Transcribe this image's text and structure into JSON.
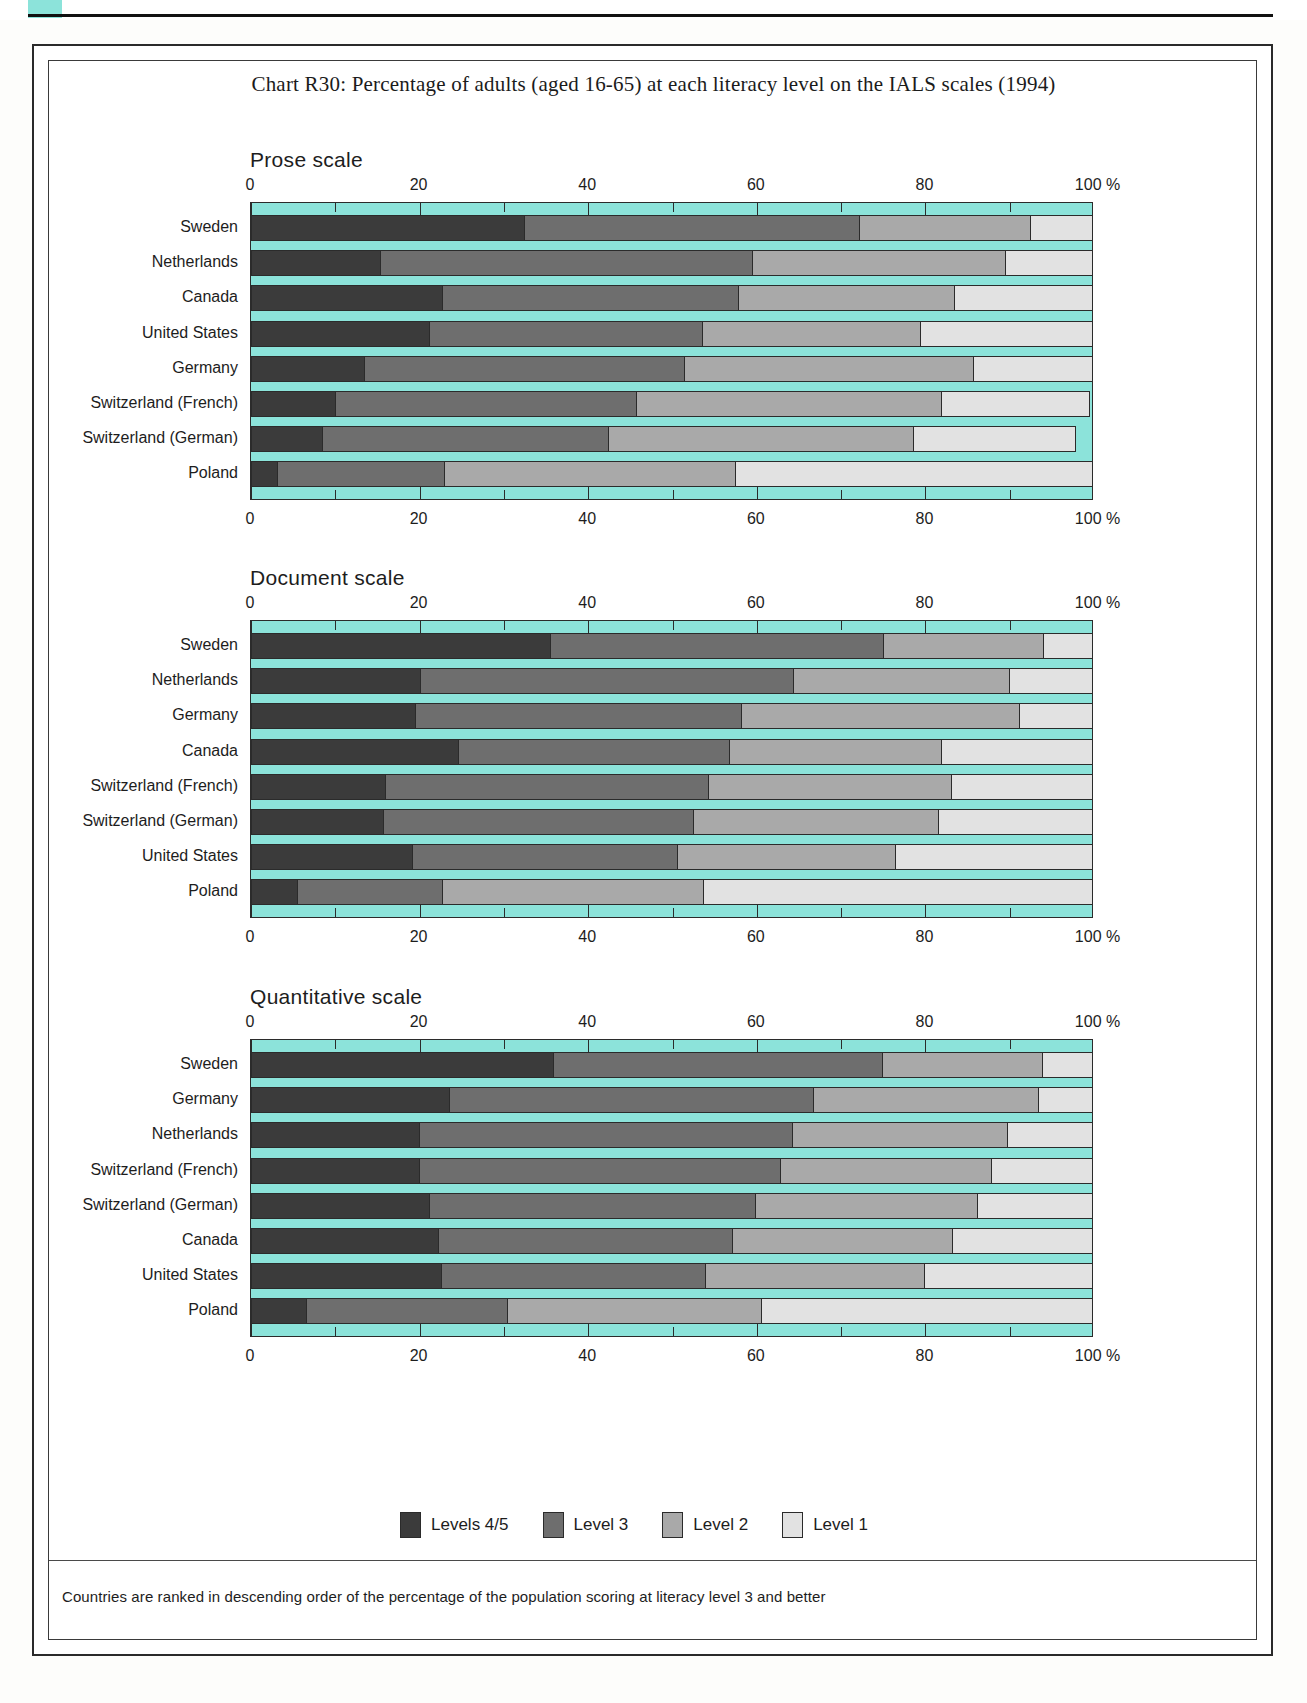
{
  "title": "Chart R30: Percentage of adults (aged 16-65) at each literacy level on the IALS scales (1994)",
  "footnote": "Countries are ranked in descending order of the percentage of the population scoring at literacy level 3 and better",
  "axis": {
    "ticks": [
      "0",
      "20",
      "40",
      "60",
      "80",
      "100"
    ],
    "unit": "%",
    "last_label": "100 %"
  },
  "legend": {
    "position": "bottom-center",
    "items": [
      {
        "label": "Levels 4/5",
        "color": "#3b3b3b",
        "key": "l45"
      },
      {
        "label": "Level 3",
        "color": "#6e6e6e",
        "key": "l3"
      },
      {
        "label": "Level 2",
        "color": "#a9a9a9",
        "key": "l2"
      },
      {
        "label": "Level 1",
        "color": "#e2e2e2",
        "key": "l1"
      }
    ]
  },
  "colors": {
    "plot_background": "#8ce3da",
    "level45": "#3b3b3b",
    "level3": "#6e6e6e",
    "level2": "#a9a9a9",
    "level1": "#e2e2e2",
    "outline": "#2b2b2b"
  },
  "panels": [
    {
      "key": "prose",
      "title": "Prose scale"
    },
    {
      "key": "document",
      "title": "Document scale"
    },
    {
      "key": "quantitative",
      "title": "Quantitative scale"
    }
  ],
  "chart_data": [
    {
      "type": "bar",
      "orientation": "horizontal",
      "stacked": true,
      "percent": true,
      "title": "Prose scale",
      "xlabel": "%",
      "ylabel": "",
      "xlim": [
        0,
        100
      ],
      "xticks": [
        0,
        20,
        40,
        60,
        80,
        100
      ],
      "grid": false,
      "legend": [
        "Levels 4/5",
        "Level 3",
        "Level 2",
        "Level 1"
      ],
      "categories": [
        "Sweden",
        "Netherlands",
        "Canada",
        "United States",
        "Germany",
        "Switzerland (French)",
        "Switzerland (German)",
        "Poland"
      ],
      "series": [
        {
          "name": "Levels 4/5",
          "values": [
            32.4,
            15.3,
            22.7,
            21.1,
            13.4,
            10.0,
            8.4,
            3.1
          ]
        },
        {
          "name": "Level 3",
          "values": [
            39.7,
            44.1,
            35.1,
            32.4,
            38.0,
            35.7,
            34.0,
            19.8
          ]
        },
        {
          "name": "Level 2",
          "values": [
            20.3,
            30.1,
            25.6,
            25.9,
            34.2,
            36.1,
            36.1,
            34.5
          ]
        },
        {
          "name": "Level 1",
          "values": [
            7.5,
            10.5,
            16.6,
            20.7,
            14.4,
            17.6,
            19.3,
            42.6
          ]
        }
      ]
    },
    {
      "type": "bar",
      "orientation": "horizontal",
      "stacked": true,
      "percent": true,
      "title": "Document scale",
      "xlabel": "%",
      "ylabel": "",
      "xlim": [
        0,
        100
      ],
      "xticks": [
        0,
        20,
        40,
        60,
        80,
        100
      ],
      "grid": false,
      "legend": [
        "Levels 4/5",
        "Level 3",
        "Level 2",
        "Level 1"
      ],
      "categories": [
        "Sweden",
        "Netherlands",
        "Germany",
        "Canada",
        "Switzerland (French)",
        "Switzerland (German)",
        "United States",
        "Poland"
      ],
      "series": [
        {
          "name": "Levels 4/5",
          "values": [
            35.5,
            20.0,
            19.5,
            24.6,
            15.9,
            15.6,
            19.1,
            5.4
          ]
        },
        {
          "name": "Level 3",
          "values": [
            39.5,
            44.3,
            38.6,
            32.1,
            38.3,
            36.8,
            31.4,
            17.2
          ]
        },
        {
          "name": "Level 2",
          "values": [
            18.9,
            25.6,
            33.0,
            25.1,
            28.8,
            29.1,
            25.9,
            31.0
          ]
        },
        {
          "name": "Level 1",
          "values": [
            6.1,
            10.1,
            8.9,
            18.2,
            17.0,
            18.5,
            23.6,
            46.4
          ]
        }
      ]
    },
    {
      "type": "bar",
      "orientation": "horizontal",
      "stacked": true,
      "percent": true,
      "title": "Quantitative scale",
      "xlabel": "%",
      "ylabel": "",
      "xlim": [
        0,
        100
      ],
      "xticks": [
        0,
        20,
        40,
        60,
        80,
        100
      ],
      "grid": false,
      "legend": [
        "Levels 4/5",
        "Level 3",
        "Level 2",
        "Level 1"
      ],
      "categories": [
        "Sweden",
        "Germany",
        "Netherlands",
        "Switzerland (French)",
        "Switzerland (German)",
        "Canada",
        "United States",
        "Poland"
      ],
      "series": [
        {
          "name": "Levels 4/5",
          "values": [
            35.8,
            23.5,
            19.9,
            19.9,
            21.1,
            22.2,
            22.5,
            6.5
          ]
        },
        {
          "name": "Level 3",
          "values": [
            39.0,
            43.2,
            44.3,
            42.9,
            38.7,
            34.8,
            31.4,
            23.9
          ]
        },
        {
          "name": "Level 2",
          "values": [
            19.0,
            26.6,
            25.5,
            25.0,
            26.3,
            26.1,
            25.9,
            30.1
          ]
        },
        {
          "name": "Level 1",
          "values": [
            6.2,
            6.7,
            10.3,
            12.2,
            13.9,
            16.9,
            20.2,
            39.5
          ]
        }
      ]
    }
  ]
}
